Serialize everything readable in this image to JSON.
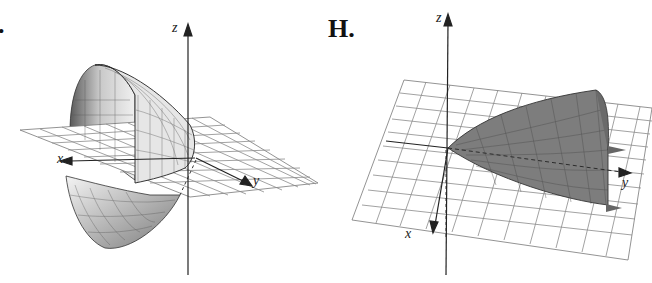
{
  "figure": {
    "panels": [
      {
        "label": ".",
        "axes": {
          "x": "x",
          "y": "y",
          "z": "z"
        },
        "description": "Elliptic paraboloid opening along negative x-axis, intersecting xy-plane grid"
      },
      {
        "label": "H.",
        "axes": {
          "x": "x",
          "y": "y",
          "z": "z"
        },
        "description": "Half paraboloid surface opening along positive y-axis above xy-plane grid"
      }
    ],
    "colors": {
      "surface_left_light": "#d8d8d8",
      "surface_left_dark": "#6a6a6a",
      "surface_right": "#7a7a7a",
      "grid": "#8a8a8a",
      "axis": "#222222"
    }
  }
}
